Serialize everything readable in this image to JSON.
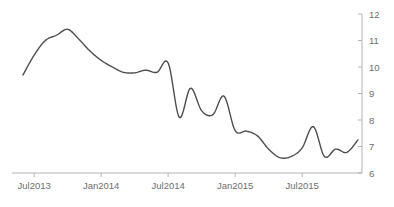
{
  "chart_data": {
    "type": "line",
    "title": "",
    "subtitle": "",
    "xlabel": "",
    "ylabel": "",
    "grid": false,
    "legend": false,
    "legend_position": "none",
    "line_color": "#4d4d4d",
    "axis_color": "#b3b3b3",
    "label_color": "#6f6f6f",
    "background": "#ffffff",
    "y_axis_position": "right",
    "ylim": [
      6,
      12
    ],
    "y_ticks": [
      6,
      7,
      8,
      9,
      10,
      11,
      12
    ],
    "y_tick_labels": [
      "6",
      "7",
      "8",
      "9",
      "10",
      "11",
      "12"
    ],
    "x_ticks": [
      "Jul2013",
      "Jan2014",
      "Jul2014",
      "Jan2015",
      "Jul2015"
    ],
    "x_tick_labels": [
      "Jul2013",
      "Jan2014",
      "Jul2014",
      "Jan2015",
      "Jul2015"
    ],
    "xlim": [
      "Jun2013",
      "Dec2015"
    ],
    "series": [
      {
        "name": "series-1",
        "color": "#4d4d4d",
        "x": [
          "Jun2013",
          "Jul2013",
          "Aug2013",
          "Sep2013",
          "Oct2013",
          "Nov2013",
          "Dec2013",
          "Jan2014",
          "Feb2014",
          "Mar2014",
          "Apr2014",
          "May2014",
          "Jun2014",
          "Jul2014",
          "Aug2014",
          "Sep2014",
          "Oct2014",
          "Nov2014",
          "Dec2014",
          "Jan2015",
          "Feb2015",
          "Mar2015",
          "Apr2015",
          "May2015",
          "Jun2015",
          "Jul2015",
          "Aug2015",
          "Sep2015",
          "Oct2015",
          "Nov2015",
          "Dec2015"
        ],
        "values": [
          9.7,
          10.45,
          11.0,
          11.2,
          11.42,
          11.05,
          10.6,
          10.25,
          10.0,
          9.8,
          9.78,
          9.88,
          9.8,
          10.15,
          8.1,
          9.2,
          8.35,
          8.2,
          8.9,
          7.6,
          7.58,
          7.4,
          6.9,
          6.58,
          6.62,
          6.95,
          7.75,
          6.62,
          6.9,
          6.78,
          7.25
        ]
      }
    ],
    "annotations": []
  }
}
